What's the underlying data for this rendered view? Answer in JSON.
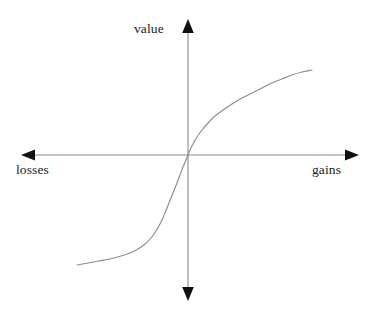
{
  "figure": {
    "name": "prospect-theory-value-function",
    "background_color": "#ffffff",
    "width": 372,
    "height": 315
  },
  "labels": {
    "value": "value",
    "losses": "losses",
    "gains": "gains"
  },
  "chart_data": {
    "type": "line",
    "title": "",
    "subtitle": "",
    "xlabel": "",
    "ylabel": "",
    "x_axis_left_label": "losses",
    "x_axis_right_label": "gains",
    "y_axis_top_label": "value",
    "grid": false,
    "legend": null,
    "axes": {
      "origin_px": [
        188,
        155
      ],
      "x_axis_y_px": 155,
      "y_axis_x_px": 188,
      "x_range_px": [
        22,
        358
      ],
      "y_range_px": [
        20,
        300
      ],
      "arrow_ends": [
        "left",
        "right",
        "up",
        "down"
      ],
      "tick_labels": [],
      "axis_color": "#8a8a8a",
      "arrow_color": "#111111"
    },
    "series": [
      {
        "name": "value function",
        "color": "#8d8d8d",
        "description": "S-shaped prospect theory value function: concave for gains, convex and steeper for losses, kinked at the reference point (origin)",
        "points_px": [
          [
            77,
            265
          ],
          [
            88,
            263
          ],
          [
            99,
            261
          ],
          [
            110,
            259
          ],
          [
            121,
            256
          ],
          [
            130,
            253
          ],
          [
            138,
            249
          ],
          [
            145,
            244
          ],
          [
            151,
            238
          ],
          [
            156,
            231
          ],
          [
            161,
            222
          ],
          [
            165,
            213
          ],
          [
            169,
            203
          ],
          [
            173,
            193
          ],
          [
            177,
            183
          ],
          [
            180,
            175
          ],
          [
            183,
            167
          ],
          [
            186,
            160
          ],
          [
            188,
            155
          ],
          [
            190,
            150
          ],
          [
            193,
            144
          ],
          [
            197,
            137
          ],
          [
            202,
            130
          ],
          [
            208,
            123
          ],
          [
            215,
            116
          ],
          [
            223,
            110
          ],
          [
            232,
            104
          ],
          [
            242,
            98
          ],
          [
            252,
            93
          ],
          [
            262,
            88
          ],
          [
            272,
            83
          ],
          [
            282,
            79
          ],
          [
            292,
            75
          ],
          [
            302,
            72
          ],
          [
            312,
            70
          ]
        ],
        "normalized_points": [
          [
            -1.0,
            -0.95
          ],
          [
            -0.85,
            -0.9
          ],
          [
            -0.7,
            -0.85
          ],
          [
            -0.55,
            -0.78
          ],
          [
            -0.45,
            -0.7
          ],
          [
            -0.36,
            -0.6
          ],
          [
            -0.28,
            -0.5
          ],
          [
            -0.21,
            -0.38
          ],
          [
            -0.15,
            -0.27
          ],
          [
            -0.1,
            -0.17
          ],
          [
            -0.05,
            -0.08
          ],
          [
            0.0,
            0.0
          ],
          [
            0.05,
            0.09
          ],
          [
            0.12,
            0.2
          ],
          [
            0.22,
            0.33
          ],
          [
            0.35,
            0.45
          ],
          [
            0.5,
            0.56
          ],
          [
            0.65,
            0.66
          ],
          [
            0.8,
            0.74
          ],
          [
            1.0,
            0.82
          ]
        ]
      }
    ],
    "annotations": [
      {
        "text": "value",
        "position": "top-of-y-axis"
      },
      {
        "text": "losses",
        "position": "left-end-of-x-axis"
      },
      {
        "text": "gains",
        "position": "right-end-of-x-axis"
      }
    ]
  }
}
